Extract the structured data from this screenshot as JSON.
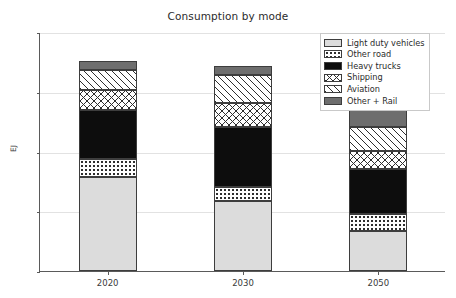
{
  "chart_data": {
    "type": "bar",
    "subtype": "stacked-bar",
    "title": "Consumption by mode",
    "xlabel": "",
    "ylabel": "EJ",
    "categories": [
      "2020",
      "2030",
      "2050"
    ],
    "ylim": [
      0,
      120
    ],
    "yticks": [
      0,
      30,
      60,
      90,
      120
    ],
    "grid": true,
    "legend_position": "upper right",
    "series": [
      {
        "name": "Light duty vehicles",
        "pattern": "solid-light-gray",
        "color": "#dcdcdc",
        "values": [
          47,
          35,
          20
        ]
      },
      {
        "name": "Other road",
        "pattern": "dots",
        "color": "#ffffff",
        "values": [
          9,
          7,
          8.5
        ]
      },
      {
        "name": "Heavy trucks",
        "pattern": "solid-black",
        "color": "#0d0d0d",
        "values": [
          25,
          30.5,
          22.5
        ]
      },
      {
        "name": "Shipping",
        "pattern": "crosshatch",
        "color": "#ffffff",
        "values": [
          10,
          12,
          9.5
        ]
      },
      {
        "name": "Aviation",
        "pattern": "diagonal-hatch",
        "color": "#ffffff",
        "values": [
          10,
          14,
          12
        ]
      },
      {
        "name": "Other + Rail",
        "pattern": "solid-gray",
        "color": "#6e6e6e",
        "values": [
          4.5,
          4.5,
          8.5
        ]
      }
    ],
    "totals": [
      105.5,
      103,
      81
    ]
  },
  "axes": {
    "y_tick_labels": [
      "0",
      "30",
      "60",
      "90",
      "120"
    ],
    "y_axis_title": "EJ",
    "x_tick_labels": [
      "2020",
      "2030",
      "2050"
    ]
  },
  "legend": {
    "entries": [
      {
        "label": "Light duty vehicles"
      },
      {
        "label": "Other road"
      },
      {
        "label": "Heavy trucks"
      },
      {
        "label": "Shipping"
      },
      {
        "label": "Aviation"
      },
      {
        "label": "Other + Rail"
      }
    ]
  }
}
